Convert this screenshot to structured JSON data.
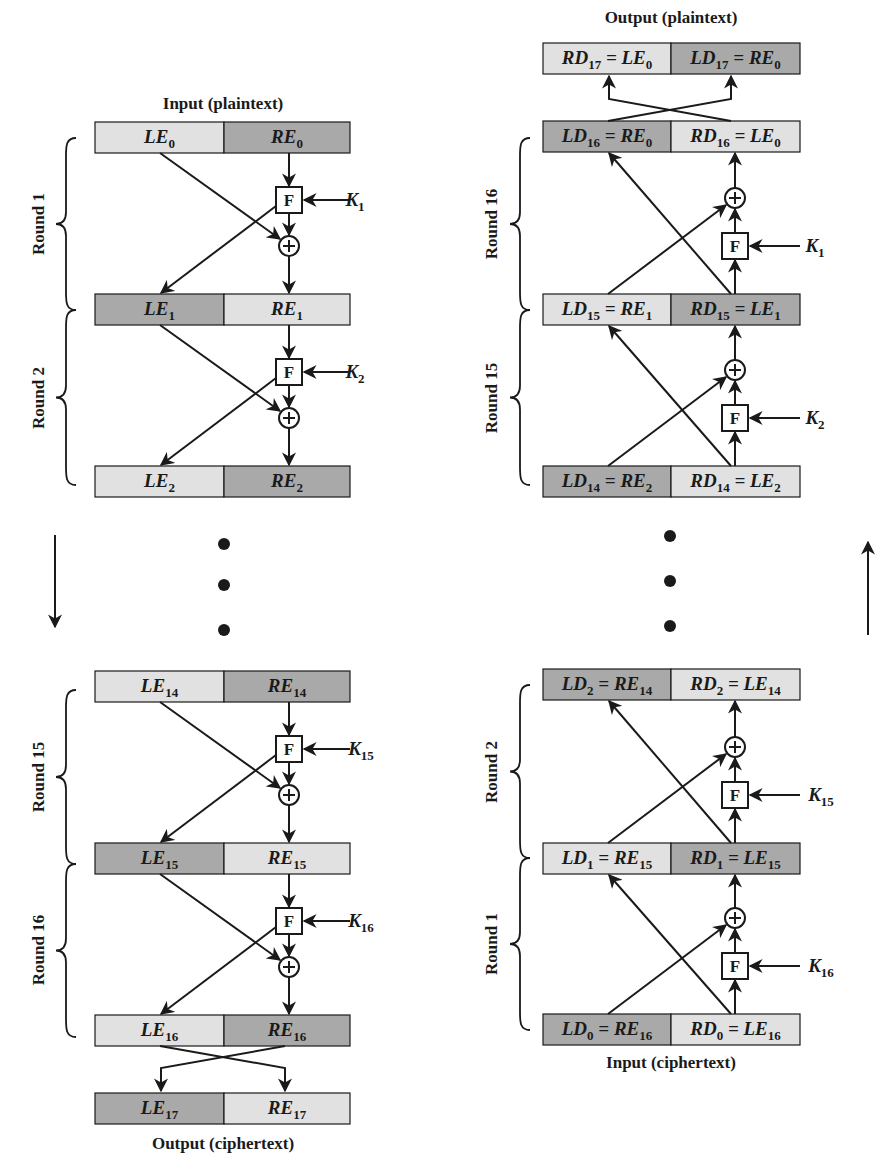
{
  "colors": {
    "light_cell": "#e1e1e1",
    "dark_cell": "#a9a9a9",
    "stroke": "#1a1a1a",
    "background": "#ffffff"
  },
  "encryption": {
    "input_caption": "Input (plaintext)",
    "output_caption": "Output (ciphertext)",
    "direction": "down",
    "rows": [
      {
        "left": {
          "base": "LE",
          "sub": "0"
        },
        "right": {
          "base": "RE",
          "sub": "0"
        },
        "shade": [
          "light",
          "dark"
        ]
      },
      {
        "left": {
          "base": "LE",
          "sub": "1"
        },
        "right": {
          "base": "RE",
          "sub": "1"
        },
        "shade": [
          "dark",
          "light"
        ]
      },
      {
        "left": {
          "base": "LE",
          "sub": "2"
        },
        "right": {
          "base": "RE",
          "sub": "2"
        },
        "shade": [
          "light",
          "dark"
        ]
      },
      {
        "left": {
          "base": "LE",
          "sub": "14"
        },
        "right": {
          "base": "RE",
          "sub": "14"
        },
        "shade": [
          "light",
          "dark"
        ]
      },
      {
        "left": {
          "base": "LE",
          "sub": "15"
        },
        "right": {
          "base": "RE",
          "sub": "15"
        },
        "shade": [
          "dark",
          "light"
        ]
      },
      {
        "left": {
          "base": "LE",
          "sub": "16"
        },
        "right": {
          "base": "RE",
          "sub": "16"
        },
        "shade": [
          "light",
          "dark"
        ]
      },
      {
        "left": {
          "base": "LE",
          "sub": "17"
        },
        "right": {
          "base": "RE",
          "sub": "17"
        },
        "shade": [
          "dark",
          "light"
        ]
      }
    ],
    "rounds": [
      {
        "label": "Round 1",
        "key": {
          "base": "K",
          "sub": "1"
        }
      },
      {
        "label": "Round 2",
        "key": {
          "base": "K",
          "sub": "2"
        }
      },
      {
        "label": "Round 15",
        "key": {
          "base": "K",
          "sub": "15"
        }
      },
      {
        "label": "Round 16",
        "key": {
          "base": "K",
          "sub": "16"
        }
      }
    ],
    "function_label": "F",
    "xor_symbol": "⊕",
    "ellipsis": "• • •"
  },
  "decryption": {
    "input_caption": "Input (ciphertext)",
    "output_caption": "Output (plaintext)",
    "direction": "up",
    "rows": [
      {
        "left": {
          "base": "RD",
          "sub": "17",
          "eq_base": "LE",
          "eq_sub": "0"
        },
        "right": {
          "base": "LD",
          "sub": "17",
          "eq_base": "RE",
          "eq_sub": "0"
        },
        "shade": [
          "light",
          "dark"
        ]
      },
      {
        "left": {
          "base": "LD",
          "sub": "16",
          "eq_base": "RE",
          "eq_sub": "0"
        },
        "right": {
          "base": "RD",
          "sub": "16",
          "eq_base": "LE",
          "eq_sub": "0"
        },
        "shade": [
          "dark",
          "light"
        ]
      },
      {
        "left": {
          "base": "LD",
          "sub": "15",
          "eq_base": "RE",
          "eq_sub": "1"
        },
        "right": {
          "base": "RD",
          "sub": "15",
          "eq_base": "LE",
          "eq_sub": "1"
        },
        "shade": [
          "light",
          "dark"
        ]
      },
      {
        "left": {
          "base": "LD",
          "sub": "14",
          "eq_base": "RE",
          "eq_sub": "2"
        },
        "right": {
          "base": "RD",
          "sub": "14",
          "eq_base": "LE",
          "eq_sub": "2"
        },
        "shade": [
          "dark",
          "light"
        ]
      },
      {
        "left": {
          "base": "LD",
          "sub": "2",
          "eq_base": "RE",
          "eq_sub": "14"
        },
        "right": {
          "base": "RD",
          "sub": "2",
          "eq_base": "LE",
          "eq_sub": "14"
        },
        "shade": [
          "dark",
          "light"
        ]
      },
      {
        "left": {
          "base": "LD",
          "sub": "1",
          "eq_base": "RE",
          "eq_sub": "15"
        },
        "right": {
          "base": "RD",
          "sub": "1",
          "eq_base": "LE",
          "eq_sub": "15"
        },
        "shade": [
          "light",
          "dark"
        ]
      },
      {
        "left": {
          "base": "LD",
          "sub": "0",
          "eq_base": "RE",
          "eq_sub": "16"
        },
        "right": {
          "base": "RD",
          "sub": "0",
          "eq_base": "LE",
          "eq_sub": "16"
        },
        "shade": [
          "dark",
          "light"
        ]
      }
    ],
    "rounds": [
      {
        "label": "Round 16",
        "key": {
          "base": "K",
          "sub": "1"
        }
      },
      {
        "label": "Round 15",
        "key": {
          "base": "K",
          "sub": "2"
        }
      },
      {
        "label": "Round 2",
        "key": {
          "base": "K",
          "sub": "15"
        }
      },
      {
        "label": "Round 1",
        "key": {
          "base": "K",
          "sub": "16"
        }
      }
    ],
    "function_label": "F",
    "xor_symbol": "⊕",
    "ellipsis": "• • •"
  }
}
